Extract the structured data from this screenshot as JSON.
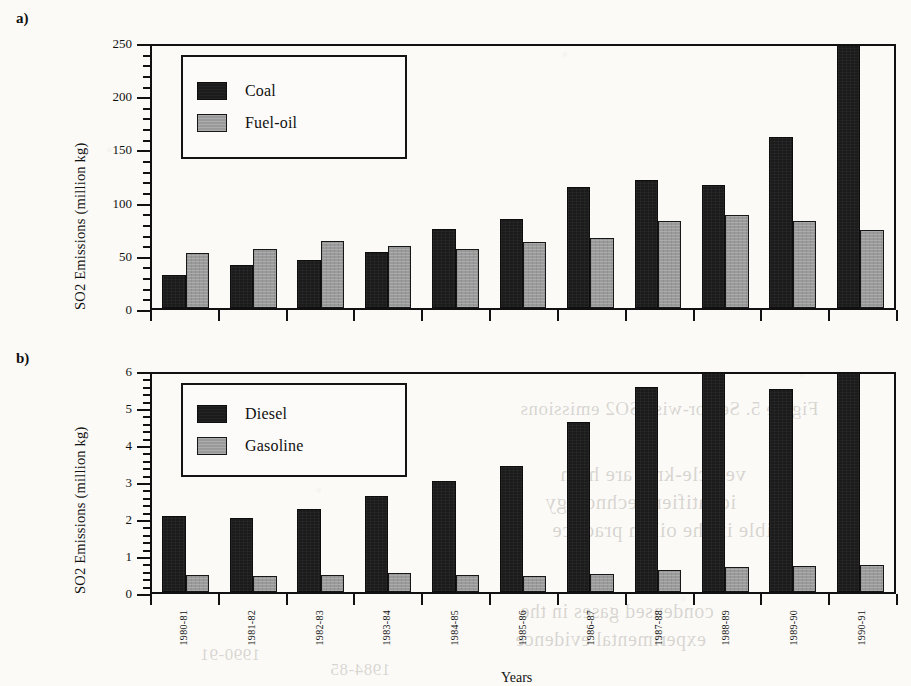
{
  "figure": {
    "panel_a_tag": "a)",
    "panel_b_tag": "b)",
    "xlabel": "Years"
  },
  "bleed_through": [
    {
      "text": "Figure 5. Sector-wise SO2 emissions",
      "x": 520,
      "y": 398,
      "size": 19
    },
    {
      "text": "vehicle-kms are high",
      "x": 560,
      "y": 462,
      "size": 21
    },
    {
      "text": "identifier Technology",
      "x": 545,
      "y": 490,
      "size": 21
    },
    {
      "text": "ssible in the oil-in practice",
      "x": 552,
      "y": 518,
      "size": 21
    },
    {
      "text": "condensed gases in the",
      "x": 520,
      "y": 600,
      "size": 20
    },
    {
      "text": "experimental evidence",
      "x": 515,
      "y": 628,
      "size": 20
    },
    {
      "text": "1990-91",
      "x": 200,
      "y": 645,
      "size": 17
    },
    {
      "text": "1984-85",
      "x": 330,
      "y": 660,
      "size": 17
    }
  ],
  "chart_data": [
    {
      "type": "bar",
      "panel": "a",
      "title": "",
      "xlabel": "Years",
      "ylabel": "SO2 Emissions (million kg)",
      "ylim": [
        0,
        250
      ],
      "ytick_major_step": 50,
      "ytick_minor_step": 10,
      "ytick_labels": [
        "0",
        "50",
        "100",
        "150",
        "200",
        "250"
      ],
      "grid": false,
      "legend_position": "upper-left-inside",
      "categories": [
        "1980-81",
        "1981-82",
        "1982-83",
        "1983-84",
        "1984-85",
        "1985-86",
        "1986-87",
        "1987-88",
        "1988-89",
        "1989-90",
        "1990-91"
      ],
      "series": [
        {
          "name": "Coal",
          "color": "#1b1b1b",
          "values": [
            31,
            40,
            45,
            53,
            74,
            84,
            114,
            120,
            116,
            161,
            252
          ]
        },
        {
          "name": "Fuel-oil",
          "color": "#9a9a9a",
          "values": [
            52,
            55,
            63,
            58,
            55,
            62,
            66,
            82,
            87,
            82,
            73
          ]
        }
      ]
    },
    {
      "type": "bar",
      "panel": "b",
      "title": "",
      "xlabel": "Years",
      "ylabel": "SO2 Emissions (million kg)",
      "ylim": [
        0,
        6
      ],
      "ytick_major_step": 1,
      "ytick_minor_step": 0.2,
      "ytick_labels": [
        "0",
        "1",
        "2",
        "3",
        "4",
        "5",
        "6"
      ],
      "grid": false,
      "legend_position": "upper-left-inside",
      "categories": [
        "1980-81",
        "1981-82",
        "1982-83",
        "1983-84",
        "1984-85",
        "1985-86",
        "1986-87",
        "1987-88",
        "1988-89",
        "1989-90",
        "1990-91"
      ],
      "series": [
        {
          "name": "Diesel",
          "color": "#1b1b1b",
          "values": [
            2.05,
            2.0,
            2.25,
            2.6,
            3.0,
            3.4,
            4.6,
            5.55,
            6.1,
            5.5,
            6.1
          ]
        },
        {
          "name": "Gasoline",
          "color": "#9a9a9a",
          "values": [
            0.45,
            0.43,
            0.47,
            0.52,
            0.45,
            0.43,
            0.5,
            0.6,
            0.68,
            0.7,
            0.72
          ]
        }
      ]
    }
  ]
}
